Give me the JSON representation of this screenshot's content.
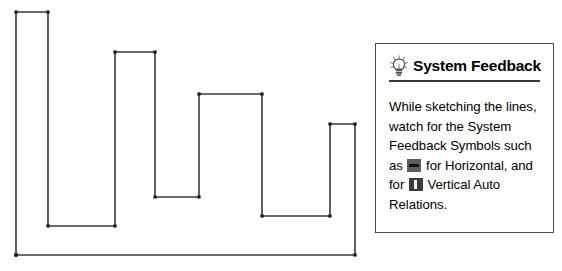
{
  "sketch": {
    "name": "square-wave-sketch",
    "stroke_color": "#3a3a3a",
    "vertex_marker_color": "#1a1a1a",
    "points": [
      [
        16,
        255
      ],
      [
        16,
        12
      ],
      [
        48,
        12
      ],
      [
        48,
        226
      ],
      [
        115,
        226
      ],
      [
        115,
        52
      ],
      [
        155,
        52
      ],
      [
        155,
        197
      ],
      [
        199,
        197
      ],
      [
        199,
        94
      ],
      [
        262,
        94
      ],
      [
        262,
        216
      ],
      [
        330,
        216
      ],
      [
        330,
        124
      ],
      [
        355,
        124
      ],
      [
        355,
        255
      ],
      [
        16,
        255
      ]
    ]
  },
  "callout": {
    "icon": "lightbulb-icon",
    "title": "System Feedback",
    "body": {
      "segment_1": "While sketching the lines, watch for the System Feedback Symbols such as ",
      "symbol_1": "horizontal-relation-symbol",
      "segment_2": " for Horizontal, and for ",
      "symbol_2": "vertical-relation-symbol",
      "segment_3": " Vertical Auto Relations."
    }
  }
}
